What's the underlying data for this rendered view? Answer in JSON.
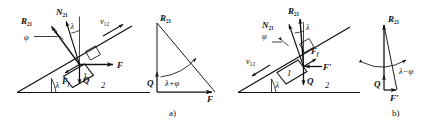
{
  "figure": {
    "type": "mechanics-free-body-diagram",
    "stroke_color": "#101010",
    "background": "#ffffff",
    "panels": [
      {
        "id": "a",
        "caption": "a)",
        "description": "Body 1 driven up incline 2: resultant reaction R21 deviates from normal N21 by friction angle phi; force triangle has angle lambda+phi.",
        "incline_angle_label": "λ",
        "surface_label": "2",
        "body_label": "1",
        "velocity_label": "v",
        "velocity_sub": "12",
        "velocity_direction": "up-the-incline",
        "vectors": [
          {
            "name": "R21",
            "label": "R",
            "sub": "21",
            "bold": true
          },
          {
            "name": "N21",
            "label": "N",
            "sub": "21",
            "bold": true
          },
          {
            "name": "F",
            "label": "F",
            "sub": "",
            "bold": true
          },
          {
            "name": "Ff",
            "label": "F",
            "sub": "f",
            "bold": true
          },
          {
            "name": "Q",
            "label": "Q",
            "sub": "",
            "bold": true
          }
        ],
        "friction_angle_label": "φ",
        "normal_tilt_label": "λ",
        "triangle": {
          "angle_label": "λ+φ",
          "sides": [
            {
              "name": "Q",
              "label": "Q",
              "bold": true
            },
            {
              "name": "F",
              "label": "F",
              "bold": true
            },
            {
              "name": "R21",
              "label": "R",
              "sub": "21",
              "bold": true
            }
          ]
        }
      },
      {
        "id": "b",
        "caption": "b)",
        "description": "Body 1 sliding down incline 2: resultant reaction R21 nearly vertical; force triangle is narrow with angle lambda-phi.",
        "incline_angle_label": "λ",
        "surface_label": "2",
        "body_label": "1",
        "velocity_label": "v",
        "velocity_sub": "12",
        "velocity_direction": "down-the-incline",
        "vectors": [
          {
            "name": "R21",
            "label": "R",
            "sub": "21",
            "bold": true
          },
          {
            "name": "N21",
            "label": "N",
            "sub": "21",
            "bold": true
          },
          {
            "name": "Fprime",
            "label": "F′",
            "sub": "",
            "bold": true
          },
          {
            "name": "Ff",
            "label": "F",
            "sub": "f",
            "bold": true
          },
          {
            "name": "Q",
            "label": "Q",
            "sub": "",
            "bold": true
          }
        ],
        "friction_angle_label": "φ",
        "normal_tilt_label": "λ",
        "triangle": {
          "angle_label": "λ−φ",
          "sides": [
            {
              "name": "Q",
              "label": "Q",
              "bold": true
            },
            {
              "name": "Fprime",
              "label": "F′",
              "bold": true
            },
            {
              "name": "R21",
              "label": "R",
              "sub": "21",
              "bold": true
            }
          ]
        }
      }
    ]
  }
}
